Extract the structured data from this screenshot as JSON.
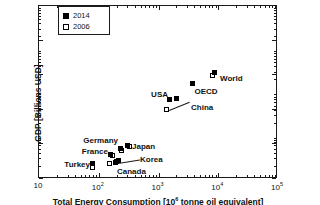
{
  "chart_data": {
    "type": "scatter",
    "title": "",
    "xlabel": "Total Energy Consumption [10⁶ tonne oil equivalent]",
    "ylabel": "GDP [Billions USD]",
    "xscale": "log",
    "yscale": "log",
    "xlim": [
      10,
      100000
    ],
    "ylim": [
      100,
      1000000
    ],
    "grid": false,
    "legend_position": "top-left",
    "xtick_labels": [
      "10",
      "10²",
      "10³",
      "10⁴",
      "10⁵"
    ],
    "xtick_values": [
      10,
      100,
      1000,
      10000,
      100000
    ],
    "ytick_labels": [
      "10²",
      "10³",
      "10⁴",
      "10⁵",
      "10⁶"
    ],
    "ytick_values": [
      100,
      1000,
      10000,
      100000,
      1000000
    ],
    "series": [
      {
        "name": "2014",
        "marker": "filled-square",
        "points": [
          {
            "label": "Turkey",
            "x": 78,
            "y": 1450
          },
          {
            "label": "France",
            "x": 155,
            "y": 2600
          },
          {
            "label": "Germany",
            "x": 225,
            "y": 4000
          },
          {
            "label": "Japan",
            "x": 295,
            "y": 4800
          },
          {
            "label": "Korea",
            "x": 210,
            "y": 1700
          },
          {
            "label": "Canada",
            "x": 190,
            "y": 1600
          },
          {
            "label": "USA",
            "x": 1520,
            "y": 17000
          },
          {
            "label": "China",
            "x": 1950,
            "y": 18000
          },
          {
            "label": "OECD",
            "x": 3700,
            "y": 50000
          },
          {
            "label": "World",
            "x": 8500,
            "y": 108000
          }
        ]
      },
      {
        "name": "2006",
        "marker": "open-square",
        "points": [
          {
            "label": "Turkey",
            "x": 76,
            "y": 1150
          },
          {
            "label": "France",
            "x": 165,
            "y": 2500
          },
          {
            "label": "Germany",
            "x": 235,
            "y": 3500
          },
          {
            "label": "Japan",
            "x": 290,
            "y": 4500
          },
          {
            "label": "Korea",
            "x": 185,
            "y": 1550
          },
          {
            "label": "Canada",
            "x": 148,
            "y": 1450
          },
          {
            "label": "China",
            "x": 1320,
            "y": 9000
          },
          {
            "label": "World",
            "x": 7800,
            "y": 88000
          }
        ]
      }
    ]
  },
  "legend": {
    "entries": [
      {
        "label": "2014",
        "style": "filled-square"
      },
      {
        "label": "2006",
        "style": "open-square"
      }
    ]
  },
  "colors": {
    "axis": "#1a1a1a",
    "text": "#111111",
    "marker_2014": "#000000",
    "marker_2006": "#ffffff",
    "background": "#ffffff"
  }
}
